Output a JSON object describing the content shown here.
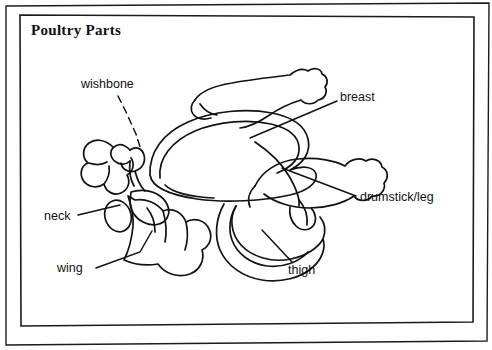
{
  "diagram": {
    "title": "Poultry Parts",
    "background_color": "#ffffff",
    "ink_color": "#111111",
    "labels": [
      {
        "id": "wishbone",
        "text": "wishbone",
        "leader": "dashed"
      },
      {
        "id": "breast",
        "text": "breast",
        "leader": "solid"
      },
      {
        "id": "drumstick-leg",
        "text": "drumstick/leg",
        "leader": "solid"
      },
      {
        "id": "neck",
        "text": "neck",
        "leader": "solid"
      },
      {
        "id": "wing",
        "text": "wing",
        "leader": "solid"
      },
      {
        "id": "thigh",
        "text": "thigh",
        "leader": "solid"
      }
    ]
  }
}
